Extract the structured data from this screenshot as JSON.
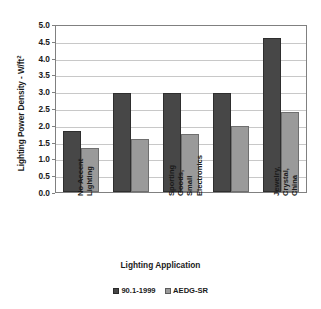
{
  "chart_data": {
    "type": "bar",
    "title": "",
    "xlabel": "Lighting Application",
    "ylabel": "Lighting Power Density - W/ft",
    "ylabel_sup": "2",
    "ylim": [
      0.0,
      5.0
    ],
    "ytick_labels": [
      "5.0",
      "4.5",
      "4.0",
      "3.5",
      "3.0",
      "2.5",
      "2.0",
      "1.5",
      "1.0",
      "0.5",
      "0.0"
    ],
    "ytick_values": [
      5.0,
      4.5,
      4.0,
      3.5,
      3.0,
      2.5,
      2.0,
      1.5,
      1.0,
      0.5,
      0.0
    ],
    "grid": true,
    "grid_axis": "y",
    "legend_position": "bottom",
    "categories": [
      "No Accent Lighting",
      "",
      "Sporting Goods, Small Electronics",
      "",
      "Jewelry, Crystal, China"
    ],
    "category_label_lines": [
      [
        "No Accent",
        "Lighting"
      ],
      [],
      [
        "Sporting",
        "Goods,",
        "Small",
        "Electronics"
      ],
      [],
      [
        "Jewelry,",
        "Crystal,",
        "China"
      ]
    ],
    "series": [
      {
        "name": "90.1-1999",
        "color": "#474747",
        "values": [
          1.83,
          2.95,
          2.95,
          2.95,
          4.57
        ]
      },
      {
        "name": "AEDG-SR",
        "color": "#9a9a9a",
        "values": [
          1.3,
          1.58,
          1.73,
          1.95,
          2.38
        ]
      }
    ]
  },
  "legend": {
    "items": [
      {
        "label": "90.1-1999",
        "color": "#474747"
      },
      {
        "label": "AEDG-SR",
        "color": "#9a9a9a"
      }
    ]
  }
}
